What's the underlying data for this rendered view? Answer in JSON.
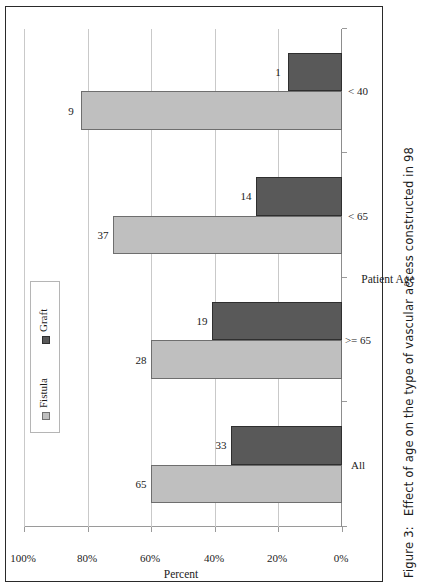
{
  "figure": {
    "caption_label": "Figure 3:",
    "caption_text": "Effect of age on the type of vascular access constructed in 98"
  },
  "chart_data": {
    "type": "bar",
    "orientation": "vertical-rendered-sideways",
    "title": "",
    "xlabel": "Patient Age",
    "ylabel": "Percent",
    "categories": [
      "All",
      ">= 65",
      "< 65",
      "< 40"
    ],
    "series": [
      {
        "name": "Fistula",
        "color": "#bfbfbf",
        "values": [
          65,
          28,
          37,
          9
        ],
        "percents": [
          60,
          60,
          72,
          82
        ]
      },
      {
        "name": "Graft",
        "color": "#595959",
        "values": [
          33,
          19,
          14,
          1
        ],
        "percents": [
          35,
          41,
          27,
          17
        ]
      }
    ],
    "ytick_labels": [
      "0%",
      "20%",
      "40%",
      "60%",
      "80%",
      "100%"
    ],
    "ytick_values": [
      0,
      20,
      40,
      60,
      80,
      100
    ],
    "ylim": [
      0,
      100
    ],
    "grid": true,
    "legend_position": "top-left",
    "data_labels": true
  },
  "legend": {
    "items": [
      {
        "label": "Fistula",
        "swatch": "fistula"
      },
      {
        "label": "Graft",
        "swatch": "graft"
      }
    ]
  }
}
